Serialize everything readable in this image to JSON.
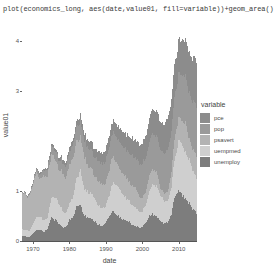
{
  "window": {
    "code_caption": "plot(economics_long, aes(date,value01, fill=variable))+geom_area()"
  },
  "legend": {
    "title": "variable",
    "items": [
      {
        "label": "pce",
        "color": "#8c8c8c"
      },
      {
        "label": "pop",
        "color": "#9a9a9a"
      },
      {
        "label": "psavert",
        "color": "#b3b3b3"
      },
      {
        "label": "uempmed",
        "color": "#cfcfcf"
      },
      {
        "label": "unemploy",
        "color": "#7d7d7d"
      }
    ]
  },
  "chart_data": {
    "type": "area",
    "stacked": true,
    "title": "",
    "xlabel": "date",
    "ylabel": "value01",
    "xlim": [
      1967,
      2015
    ],
    "ylim": [
      0,
      4.3
    ],
    "grid": false,
    "legend_position": "right",
    "xticks": [
      "1970",
      "1980",
      "1990",
      "2000",
      "2010"
    ],
    "xtick_values": [
      1970,
      1980,
      1990,
      2000,
      2010
    ],
    "yticks": [
      "0",
      "1",
      "3",
      "4"
    ],
    "ytick_values": [
      0,
      1,
      3,
      4
    ],
    "x": [
      1967,
      1968,
      1969,
      1970,
      1971,
      1972,
      1973,
      1974,
      1975,
      1976,
      1977,
      1978,
      1979,
      1980,
      1981,
      1982,
      1983,
      1984,
      1985,
      1986,
      1987,
      1988,
      1989,
      1990,
      1991,
      1992,
      1993,
      1994,
      1995,
      1996,
      1997,
      1998,
      1999,
      2000,
      2001,
      2002,
      2003,
      2004,
      2005,
      2006,
      2007,
      2008,
      2009,
      2010,
      2011,
      2012,
      2013,
      2014,
      2015
    ],
    "series": [
      {
        "name": "unemploy",
        "color": "#7d7d7d",
        "values": [
          0.1,
          0.09,
          0.08,
          0.16,
          0.23,
          0.22,
          0.18,
          0.24,
          0.46,
          0.42,
          0.36,
          0.28,
          0.27,
          0.42,
          0.47,
          0.68,
          0.72,
          0.5,
          0.48,
          0.47,
          0.39,
          0.33,
          0.31,
          0.36,
          0.52,
          0.59,
          0.53,
          0.45,
          0.42,
          0.4,
          0.34,
          0.3,
          0.28,
          0.26,
          0.38,
          0.51,
          0.53,
          0.47,
          0.4,
          0.35,
          0.37,
          0.53,
          0.93,
          1.0,
          0.92,
          0.82,
          0.75,
          0.63,
          0.55
        ]
      },
      {
        "name": "uempmed",
        "color": "#cfcfcf",
        "values": [
          0.14,
          0.13,
          0.12,
          0.18,
          0.26,
          0.27,
          0.22,
          0.22,
          0.38,
          0.45,
          0.42,
          0.33,
          0.28,
          0.33,
          0.41,
          0.55,
          0.7,
          0.55,
          0.5,
          0.5,
          0.45,
          0.39,
          0.35,
          0.33,
          0.44,
          0.58,
          0.59,
          0.55,
          0.46,
          0.45,
          0.4,
          0.36,
          0.33,
          0.31,
          0.36,
          0.52,
          0.62,
          0.6,
          0.51,
          0.44,
          0.43,
          0.52,
          0.8,
          1.0,
          0.99,
          0.93,
          0.86,
          0.76,
          0.68
        ]
      },
      {
        "name": "psavert",
        "color": "#b3b3b3",
        "values": [
          0.72,
          0.7,
          0.69,
          0.8,
          0.84,
          0.75,
          0.88,
          0.85,
          0.88,
          0.78,
          0.7,
          0.73,
          0.72,
          0.75,
          0.8,
          0.77,
          0.65,
          0.68,
          0.55,
          0.52,
          0.44,
          0.48,
          0.47,
          0.46,
          0.5,
          0.54,
          0.45,
          0.41,
          0.42,
          0.4,
          0.38,
          0.4,
          0.32,
          0.27,
          0.28,
          0.32,
          0.29,
          0.29,
          0.14,
          0.17,
          0.18,
          0.3,
          0.45,
          0.44,
          0.5,
          0.6,
          0.4,
          0.42,
          0.45
        ]
      },
      {
        "name": "pop",
        "color": "#9a9a9a",
        "values": [
          0.0,
          0.02,
          0.03,
          0.05,
          0.07,
          0.09,
          0.11,
          0.13,
          0.15,
          0.17,
          0.19,
          0.21,
          0.23,
          0.25,
          0.27,
          0.29,
          0.31,
          0.33,
          0.35,
          0.37,
          0.39,
          0.41,
          0.43,
          0.45,
          0.47,
          0.49,
          0.51,
          0.53,
          0.55,
          0.57,
          0.59,
          0.61,
          0.63,
          0.66,
          0.68,
          0.7,
          0.72,
          0.74,
          0.76,
          0.79,
          0.81,
          0.83,
          0.85,
          0.87,
          0.9,
          0.92,
          0.94,
          0.97,
          1.0
        ]
      },
      {
        "name": "pce",
        "color": "#8c8c8c",
        "values": [
          0.0,
          0.01,
          0.01,
          0.02,
          0.02,
          0.03,
          0.03,
          0.04,
          0.05,
          0.05,
          0.06,
          0.07,
          0.08,
          0.09,
          0.1,
          0.11,
          0.12,
          0.13,
          0.15,
          0.16,
          0.17,
          0.19,
          0.2,
          0.22,
          0.23,
          0.25,
          0.26,
          0.28,
          0.3,
          0.32,
          0.34,
          0.36,
          0.38,
          0.41,
          0.43,
          0.45,
          0.48,
          0.51,
          0.55,
          0.58,
          0.62,
          0.65,
          0.64,
          0.67,
          0.72,
          0.77,
          0.81,
          0.87,
          0.93
        ]
      }
    ]
  }
}
